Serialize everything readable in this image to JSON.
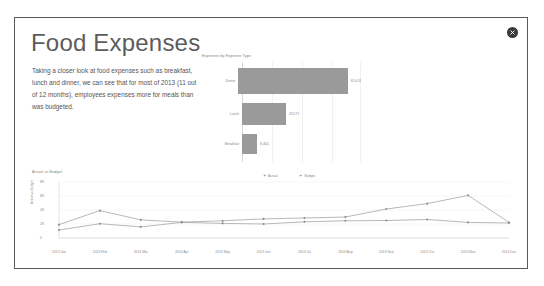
{
  "window": {
    "close_label": "×",
    "close_icon": "close-circle-icon"
  },
  "header": {
    "title": "Food Expenses"
  },
  "body": {
    "paragraph": "Taking a closer look at food expenses such as breakfast, lunch and dinner, we can see that for most of 2013 (11 out of 12 months), employees expenses more for meals than was budgeted."
  },
  "colors": {
    "bar_fill": "#9a9a9a",
    "line_stroke": "#9a9a9a",
    "text": "#888888",
    "card_border": "#5a5a5a",
    "close_bg": "#3a3a3a"
  },
  "chart_data": [
    {
      "type": "bar",
      "orientation": "horizontal",
      "title": "Expenses by Expense Type",
      "categories": [
        "Dinner",
        "Lunch",
        "Breakfast"
      ],
      "values": [
        61074,
        24571,
        8464
      ],
      "value_labels": [
        "61,074",
        "24,571",
        "8,464"
      ],
      "xlabel": "",
      "ylabel": "",
      "xlim": [
        0,
        66000
      ],
      "grid": true,
      "legend": "none"
    },
    {
      "type": "line",
      "title": "Actual vs Budget",
      "xlabel": "",
      "ylabel": "Actual vs Budget",
      "x": [
        "2013 Jan",
        "2013 Feb",
        "2013 Mar",
        "2013 Apr",
        "2013 May",
        "2013 Jun",
        "2013 Jul",
        "2013 Aug",
        "2013 Sep",
        "2013 Oct",
        "2013 Nov",
        "2013 Dec"
      ],
      "yticks": [
        "0",
        "2K",
        "4K",
        "6K",
        "8K"
      ],
      "ylim": [
        0,
        8800
      ],
      "grid": true,
      "legend": "top-right",
      "series": [
        {
          "name": "Actual",
          "values": [
            2100,
            4300,
            2850,
            2500,
            2700,
            3000,
            3150,
            3300,
            4550,
            5400,
            6700,
            2450
          ]
        },
        {
          "name": "Budget",
          "values": [
            1250,
            2250,
            1750,
            2450,
            2300,
            2200,
            2550,
            2700,
            2750,
            2900,
            2450,
            2350
          ]
        }
      ]
    }
  ]
}
